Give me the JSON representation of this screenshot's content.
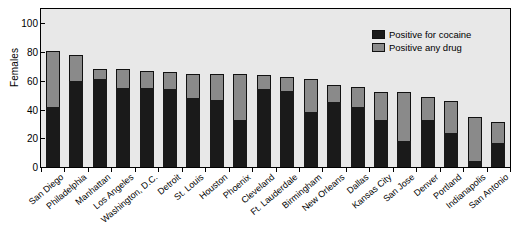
{
  "chart_data": {
    "type": "bar",
    "subtype": "stacked-bar",
    "title": "",
    "xlabel": "",
    "ylabel": "Females",
    "ylim": [
      0,
      110
    ],
    "yticks": [
      0,
      20,
      40,
      60,
      80,
      100
    ],
    "grid": false,
    "legend_position": "top-right",
    "categories": [
      "San Diego",
      "Philadelphia",
      "Manhattan",
      "Los Angeles",
      "Washington, D.C.",
      "Detroit",
      "St. Louis",
      "Houston",
      "Phoenix",
      "Cleveland",
      "Ft. Lauderdale",
      "Birmingham",
      "New Orleans",
      "Dallas",
      "Kansas City",
      "San Jose",
      "Denver",
      "Portland",
      "Indianapolis",
      "San Antonio"
    ],
    "series": [
      {
        "name": "Positive for cocaine",
        "color": "#1a1a1a",
        "values": [
          42,
          60,
          61,
          55,
          55,
          54,
          48,
          47,
          33,
          54,
          53,
          38,
          45,
          42,
          33,
          18,
          33,
          24,
          4,
          17
        ]
      },
      {
        "name": "Positive any drug",
        "color": "#8a8a8a",
        "values": [
          81,
          78,
          68,
          68,
          67,
          66,
          65,
          65,
          65,
          64,
          63,
          61,
          57,
          56,
          52,
          52,
          49,
          46,
          35,
          31
        ]
      }
    ]
  },
  "legend": {
    "items": [
      {
        "label": "Positive for cocaine",
        "swatch": "black-square-icon"
      },
      {
        "label": "Positive any drug",
        "swatch": "gray-square-icon"
      }
    ]
  },
  "axis": {
    "y_title": "Females",
    "y_tick_labels": [
      "0",
      "20",
      "40",
      "60",
      "80",
      "100"
    ]
  }
}
